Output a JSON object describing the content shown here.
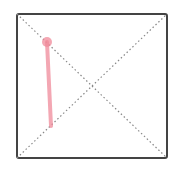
{
  "box": {
    "x": 17,
    "y": 14,
    "width": 150,
    "height": 144,
    "stroke": "#444444",
    "stroke_width": 2,
    "radius": 2
  },
  "diagonals": {
    "stroke": "#888888",
    "dash": "1.5 2.5"
  },
  "gesture": {
    "color": "#f08a9a",
    "opacity": 0.75,
    "start": {
      "x": 47,
      "y": 42
    },
    "end": {
      "x": 51,
      "y": 126
    },
    "dot_radius": 5
  }
}
